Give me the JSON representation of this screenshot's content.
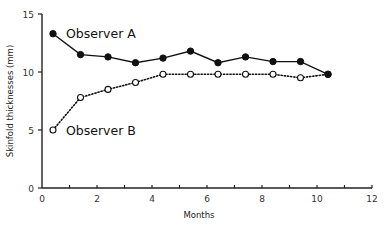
{
  "chart_data": {
    "type": "line",
    "title": "",
    "xlabel": "Months",
    "ylabel": "Skinfold thicknesses (mm)",
    "xlim": [
      0,
      12
    ],
    "ylim": [
      0,
      15
    ],
    "x_ticks": [
      0,
      2,
      4,
      6,
      8,
      10,
      12
    ],
    "x_minor_ticks": [
      1,
      3,
      5,
      7,
      9,
      11
    ],
    "y_ticks": [
      0,
      5,
      10,
      15
    ],
    "grid": false,
    "legend": "inline labels",
    "x": [
      0.4,
      1.4,
      2.4,
      3.4,
      4.4,
      5.4,
      6.4,
      7.4,
      8.4,
      9.4,
      10.4
    ],
    "series": [
      {
        "name": "Observer A",
        "marker": "filled-circle",
        "line": "solid",
        "values": [
          13.3,
          11.5,
          11.3,
          10.8,
          11.2,
          11.8,
          10.8,
          11.3,
          10.9,
          10.9,
          9.8
        ]
      },
      {
        "name": "Observer B",
        "marker": "open-circle",
        "line": "dotted",
        "values": [
          5.0,
          7.8,
          8.5,
          9.1,
          9.8,
          9.8,
          9.8,
          9.8,
          9.8,
          9.5,
          9.8
        ]
      }
    ],
    "colors": {
      "line": "#111111",
      "axis": "#222222",
      "text": "#333333"
    }
  },
  "labels": {
    "xlabel": "Months",
    "ylabel": "Skinfold thicknesses (mm)",
    "series_a": "Observer A",
    "series_b": "Observer B"
  }
}
